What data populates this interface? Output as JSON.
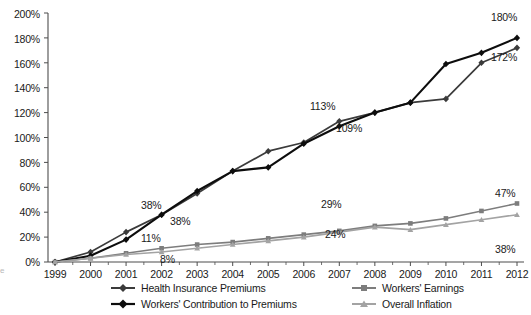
{
  "chart_data": {
    "type": "line",
    "title": "",
    "subtitle": "",
    "xlabel": "",
    "ylabel": "",
    "categories": [
      "1999",
      "2000",
      "2001",
      "2002",
      "2003",
      "2004",
      "2005",
      "2006",
      "2007",
      "2008",
      "2009",
      "2010",
      "2011",
      "2012"
    ],
    "ylim": [
      0,
      200
    ],
    "yticks": [
      "0%",
      "20%",
      "40%",
      "60%",
      "80%",
      "100%",
      "120%",
      "140%",
      "160%",
      "180%",
      "200%"
    ],
    "ytick_values": [
      0,
      20,
      40,
      60,
      80,
      100,
      120,
      140,
      160,
      180,
      200
    ],
    "grid": false,
    "legend_position": "bottom",
    "series": [
      {
        "name": "Health Insurance Premiums",
        "color": "#3b3b3b",
        "marker": "diamond",
        "values": [
          0,
          8,
          24,
          38,
          55,
          73,
          89,
          96,
          113,
          120,
          128,
          131,
          160,
          172
        ],
        "labels": [
          {
            "category": "2002",
            "text": "38%",
            "position": "above"
          },
          {
            "category": "2007",
            "text": "113%",
            "position": "above"
          },
          {
            "category": "2012",
            "text": "172%",
            "position": "below"
          }
        ]
      },
      {
        "name": "Workers' Contribution to Premiums",
        "color": "#0d0d0d",
        "marker": "diamond",
        "values": [
          0,
          5,
          18,
          38,
          57,
          73,
          76,
          95,
          109,
          120,
          128,
          159,
          168,
          180
        ],
        "labels": [
          {
            "category": "2002",
            "text": "38%",
            "position": "below"
          },
          {
            "category": "2007",
            "text": "109%",
            "position": "below"
          },
          {
            "category": "2012",
            "text": "180%",
            "position": "above"
          }
        ]
      },
      {
        "name": "Workers' Earnings",
        "color": "#7d7d7d",
        "marker": "square",
        "values": [
          0,
          3,
          7,
          11,
          14,
          16,
          19,
          22,
          25,
          29,
          31,
          35,
          41,
          47
        ],
        "labels": [
          {
            "category": "2007",
            "text": "29%",
            "position": "above"
          },
          {
            "category": "2012",
            "text": "47%",
            "position": "above"
          }
        ]
      },
      {
        "name": "Overall Inflation",
        "color": "#a3a3a3",
        "marker": "triangle",
        "values": [
          0,
          3,
          6,
          8,
          11,
          14,
          17,
          20,
          24,
          28,
          26,
          30,
          34,
          38
        ],
        "labels": [
          {
            "category": "2007",
            "text": "24%",
            "position": "below"
          },
          {
            "category": "2012",
            "text": "38%",
            "position": "below"
          }
        ]
      }
    ],
    "data_labels": [
      {
        "text": "38%",
        "x": 141,
        "y": 199
      },
      {
        "text": "38%",
        "x": 170,
        "y": 215
      },
      {
        "text": "11%",
        "x": 141,
        "y": 232
      },
      {
        "text": "8%",
        "x": 160,
        "y": 253
      },
      {
        "text": "113%",
        "x": 310,
        "y": 100
      },
      {
        "text": "109%",
        "x": 336,
        "y": 122
      },
      {
        "text": "29%",
        "x": 321,
        "y": 198
      },
      {
        "text": "24%",
        "x": 325,
        "y": 228
      },
      {
        "text": "180%",
        "x": 491,
        "y": 11
      },
      {
        "text": "172%",
        "x": 491,
        "y": 51
      },
      {
        "text": "47%",
        "x": 495,
        "y": 187
      },
      {
        "text": "38%",
        "x": 495,
        "y": 243
      }
    ],
    "axis_corner_glyph": "е"
  }
}
